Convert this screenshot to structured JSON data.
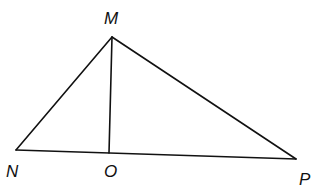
{
  "diagram": {
    "type": "triangle-with-segment",
    "points": {
      "M": {
        "label": "M",
        "x": 112,
        "y": 37,
        "label_x": 104,
        "label_y": 24
      },
      "N": {
        "label": "N",
        "x": 16,
        "y": 150,
        "label_x": 6,
        "label_y": 177
      },
      "O": {
        "label": "O",
        "x": 109,
        "y": 153,
        "label_x": 104,
        "label_y": 177
      },
      "P": {
        "label": "P",
        "x": 296,
        "y": 159,
        "label_x": 299,
        "label_y": 185
      }
    },
    "segments": [
      {
        "name": "MN",
        "from": "M",
        "to": "N"
      },
      {
        "name": "MP",
        "from": "M",
        "to": "P"
      },
      {
        "name": "NP",
        "from": "N",
        "to": "P"
      },
      {
        "name": "MO",
        "from": "M",
        "to": "O"
      }
    ]
  }
}
